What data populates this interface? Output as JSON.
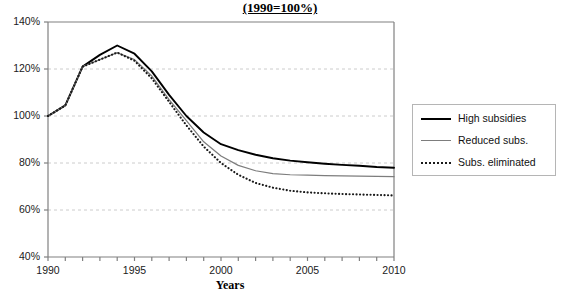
{
  "chart_data": {
    "type": "line",
    "title": "(1990=100%)",
    "xlabel": "Years",
    "ylabel": "",
    "xlim": [
      1990,
      2010
    ],
    "ylim": [
      40,
      140
    ],
    "ytick_step": 20,
    "grid": "horizontal-dashed",
    "legend_position": "right-outside",
    "x": [
      1990,
      1991,
      1992,
      1993,
      1994,
      1995,
      1996,
      1997,
      1998,
      1999,
      2000,
      2001,
      2002,
      2003,
      2004,
      2005,
      2006,
      2007,
      2008,
      2009,
      2010
    ],
    "ytick_labels": [
      "140%",
      "120%",
      "100%",
      "80%",
      "60%",
      "40%"
    ],
    "ytick_values": [
      140,
      120,
      100,
      80,
      60,
      40
    ],
    "xtick_labels": [
      "1990",
      "1995",
      "2000",
      "2005",
      "2010"
    ],
    "xtick_values": [
      1990,
      1995,
      2000,
      2005,
      2010
    ],
    "series": [
      {
        "name": "High subsidies",
        "style": "solid-thick",
        "color": "#000000",
        "values": [
          100,
          104.5,
          121,
          126,
          130,
          126.5,
          119,
          109,
          100,
          93,
          88,
          85.5,
          83.5,
          82,
          81,
          80.3,
          79.7,
          79.2,
          78.8,
          78.3,
          78
        ]
      },
      {
        "name": "Reduced subs.",
        "style": "solid-thin",
        "color": "#7d7d7d",
        "values": [
          100,
          104.5,
          121,
          124,
          127,
          124,
          117,
          107,
          98,
          89,
          83,
          79,
          76.7,
          75.5,
          75,
          74.8,
          74.6,
          74.5,
          74.4,
          74.3,
          74.2
        ]
      },
      {
        "name": "Subs. eliminated",
        "style": "dotted",
        "color": "#1a1a1a",
        "values": [
          100,
          104.5,
          121,
          124,
          127,
          123.5,
          116,
          106,
          96,
          87,
          80,
          75,
          71.5,
          69.5,
          68.2,
          67.5,
          67.1,
          66.8,
          66.6,
          66.4,
          66.2
        ]
      }
    ]
  },
  "legend": {
    "items": [
      {
        "label": "High subsidies"
      },
      {
        "label": "Reduced subs."
      },
      {
        "label": "Subs. eliminated"
      }
    ]
  }
}
